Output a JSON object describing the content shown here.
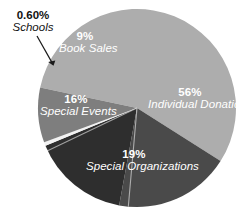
{
  "chart_data": {
    "type": "pie",
    "title": "",
    "subtitle": "",
    "xlabel": "",
    "ylabel": "",
    "grid": false,
    "legend_position": "none",
    "label_style": "in-slice with leader line for smallest slice",
    "units": "percent",
    "total": 100.6,
    "categories": [
      "Individual Donations",
      "Special Organizations",
      "Special Events",
      "Schools",
      "Book Sales"
    ],
    "values": [
      56,
      19,
      16,
      0.6,
      9
    ],
    "value_labels": [
      "56%",
      "19%",
      "16%",
      "0.60%",
      "9%"
    ],
    "slices": [
      {
        "name": "Individual Donations",
        "value": 56,
        "value_label": "56%",
        "color": "#adadad",
        "label_color": "#ffffff",
        "label_placement": "inside"
      },
      {
        "name": "Special Organizations",
        "value": 19,
        "value_label": "19%",
        "color": "#4a4a4a",
        "label_color": "#ffffff",
        "label_placement": "inside"
      },
      {
        "name": "Special Events",
        "value": 16,
        "value_label": "16%",
        "color": "#2e2e2e",
        "label_color": "#ffffff",
        "label_placement": "inside"
      },
      {
        "name": "Schools",
        "value": 0.6,
        "value_label": "0.60%",
        "color": "#f2f2f2",
        "label_color": "#111111",
        "label_placement": "outside-callout"
      },
      {
        "name": "Book Sales",
        "value": 9,
        "value_label": "9%",
        "color": "#7e7e7e",
        "label_color": "#ffffff",
        "label_placement": "inside"
      }
    ],
    "annotations": [
      {
        "text": "0.60% Schools",
        "type": "leader-arrow",
        "points_to": "Schools"
      }
    ]
  },
  "colors": {
    "background": "#ffffff",
    "individual_donations": "#adadad",
    "special_organizations": "#4a4a4a",
    "special_events": "#2e2e2e",
    "schools": "#f2f2f2",
    "book_sales": "#7e7e7e",
    "callout_text": "#111111",
    "in_slice_text": "#ffffff",
    "leader_line": "#1a1a1a"
  }
}
